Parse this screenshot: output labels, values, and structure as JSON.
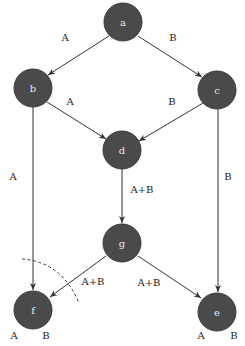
{
  "diagram": {
    "type": "directed-graph",
    "nodes": [
      {
        "id": "a",
        "label": "a",
        "x": 123,
        "y": 22
      },
      {
        "id": "b",
        "label": "b",
        "x": 33,
        "y": 88
      },
      {
        "id": "c",
        "label": "c",
        "x": 217,
        "y": 90
      },
      {
        "id": "d",
        "label": "d",
        "x": 122,
        "y": 150
      },
      {
        "id": "g",
        "label": "g",
        "x": 122,
        "y": 243
      },
      {
        "id": "f",
        "label": "f",
        "x": 33,
        "y": 310
      },
      {
        "id": "e",
        "label": "e",
        "x": 217,
        "y": 312
      }
    ],
    "edges": [
      {
        "from": "a",
        "to": "b",
        "label": "A"
      },
      {
        "from": "a",
        "to": "c",
        "label": "B"
      },
      {
        "from": "b",
        "to": "d",
        "label": "A"
      },
      {
        "from": "c",
        "to": "d",
        "label": "B"
      },
      {
        "from": "b",
        "to": "f",
        "label": "A"
      },
      {
        "from": "c",
        "to": "e",
        "label": "B"
      },
      {
        "from": "d",
        "to": "g",
        "label": "A+B"
      },
      {
        "from": "g",
        "to": "f",
        "label": "A+B"
      },
      {
        "from": "g",
        "to": "e",
        "label": "A+B"
      }
    ],
    "edge_labels": {
      "ab": "A",
      "ac": "B",
      "bd": "A",
      "cd": "B",
      "bf": "A",
      "ce": "B",
      "dg": "A+B",
      "gf": "A+B",
      "ge": "A+B"
    },
    "node_annotations": {
      "f_left": "A",
      "f_right": "B",
      "e_left": "A",
      "e_right": "B"
    },
    "colors": {
      "node_fill": "#4a4a4a",
      "node_text": "#e8e8e8",
      "edge": "#333333",
      "background": "#ffffff"
    }
  }
}
